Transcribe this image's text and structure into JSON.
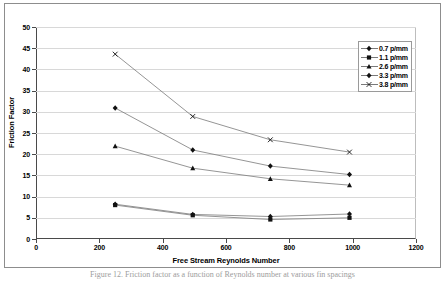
{
  "figure": {
    "caption": "Figure 12.  Friction factor as a function of Reynolds number at various fin spacings"
  },
  "chart_data": {
    "type": "line",
    "title": "",
    "xlabel": "Free Stream Reynolds Number",
    "ylabel": "Friction Factor",
    "xlim": [
      0,
      1200
    ],
    "ylim": [
      0,
      50
    ],
    "xticks": [
      0,
      200,
      400,
      600,
      800,
      1000,
      1200
    ],
    "yticks": [
      0,
      5,
      10,
      15,
      20,
      25,
      30,
      35,
      40,
      45,
      50
    ],
    "grid": "horizontal",
    "legend_position": "top-right",
    "x": [
      250,
      495,
      740,
      990
    ],
    "series": [
      {
        "name": "0.7 p/mm",
        "marker": "diamond",
        "values": [
          8.2,
          5.8,
          5.3,
          5.9
        ]
      },
      {
        "name": "1.1 p/mm",
        "marker": "square",
        "values": [
          8.0,
          5.6,
          4.6,
          5.0
        ]
      },
      {
        "name": "2.6 p/mm",
        "marker": "triangle",
        "values": [
          21.9,
          16.7,
          14.2,
          12.7
        ]
      },
      {
        "name": "3.3 p/mm",
        "marker": "diamond",
        "values": [
          30.9,
          21.0,
          17.2,
          15.2
        ]
      },
      {
        "name": "3.8 p/mm",
        "marker": "x",
        "values": [
          43.6,
          28.9,
          23.4,
          20.5
        ]
      }
    ]
  },
  "colors": {
    "axis": "#4a4a4a",
    "grid": "#d8d8d8",
    "series": "#7a7a7a",
    "marker": "#111111",
    "frame": "#8d8d8d",
    "caption": "#9d9d9d"
  }
}
